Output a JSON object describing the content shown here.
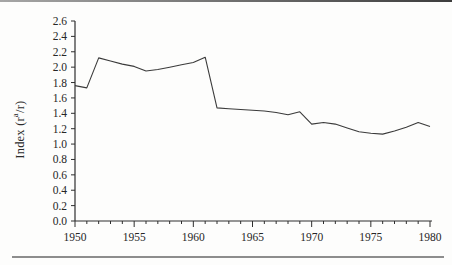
{
  "chart_data": {
    "type": "line",
    "title": "",
    "xlabel": "",
    "ylabel": "Index (rᵃ/r)",
    "ylabel_parts": {
      "pre": "Index (r",
      "sup": "a",
      "post": "/r)"
    },
    "x": [
      1950,
      1951,
      1952,
      1953,
      1954,
      1955,
      1956,
      1957,
      1958,
      1959,
      1960,
      1961,
      1962,
      1963,
      1964,
      1965,
      1966,
      1967,
      1968,
      1969,
      1970,
      1971,
      1972,
      1973,
      1974,
      1975,
      1976,
      1977,
      1978,
      1979,
      1980
    ],
    "values": [
      1.76,
      1.73,
      2.12,
      2.08,
      2.04,
      2.01,
      1.95,
      1.97,
      2.0,
      2.03,
      2.06,
      2.13,
      1.47,
      1.46,
      1.45,
      1.44,
      1.43,
      1.41,
      1.38,
      1.42,
      1.26,
      1.28,
      1.26,
      1.21,
      1.16,
      1.14,
      1.13,
      1.17,
      1.22,
      1.28,
      1.23
    ],
    "xlim": [
      1950,
      1980
    ],
    "ylim": [
      0.0,
      2.6
    ],
    "ytick_step": 0.2,
    "ytick_labels": [
      "0.0",
      "0.2",
      "0.4",
      "0.6",
      "0.8",
      "1.0",
      "1.2",
      "1.4",
      "1.6",
      "1.8",
      "2.0",
      "2.2",
      "2.4",
      "2.6"
    ],
    "xtick_minor_step": 1,
    "xtick_label_step": 5,
    "xtick_labels": [
      "1950",
      "1955",
      "1960",
      "1965",
      "1970",
      "1975",
      "1980"
    ],
    "grid": false,
    "legend": null,
    "colors": {
      "line": "#3b3b3b",
      "axis": "#2e2e2e",
      "text": "#262626"
    }
  }
}
